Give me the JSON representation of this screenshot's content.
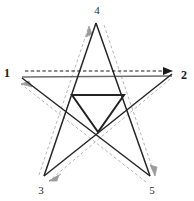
{
  "diagram": {
    "type": "pentagram-with-directed-path",
    "colors": {
      "background": "#ffffff",
      "star_edge": "#262626",
      "base_line": "#6e6e6e",
      "path_dash": "#b6b6b6",
      "main_dash": "#1a1a1a",
      "inner_triangle": "#232323",
      "label": "#1a1a1a"
    },
    "vertices": [
      {
        "id": "v1",
        "label": "1",
        "x": 10,
        "y": 72,
        "point_x": 24,
        "point_y": 73,
        "label_anchor": "end",
        "bold": true
      },
      {
        "id": "v2",
        "label": "2",
        "x": 186,
        "y": 73,
        "point_x": 171,
        "point_y": 73,
        "label_anchor": "start",
        "bold": true
      },
      {
        "id": "v3",
        "label": "3",
        "x": 41,
        "y": 190,
        "point_x": 44,
        "point_y": 177,
        "label_anchor": "middle",
        "bold": false
      },
      {
        "id": "v4",
        "label": "4",
        "x": 97,
        "y": 13,
        "point_x": 97,
        "point_y": 22,
        "label_anchor": "middle",
        "bold": false
      },
      {
        "id": "v5",
        "label": "5",
        "x": 152,
        "y": 190,
        "point_x": 150,
        "point_y": 177,
        "label_anchor": "middle",
        "bold": false
      }
    ],
    "star_outline_order": [
      "1",
      "2",
      "3",
      "4",
      "5",
      "1"
    ],
    "edges": [
      {
        "from": "1",
        "to": "2",
        "style": "solid-gray-horizontal"
      },
      {
        "from": "2",
        "to": "3",
        "style": "solid-black"
      },
      {
        "from": "3",
        "to": "4",
        "style": "solid-black"
      },
      {
        "from": "4",
        "to": "5",
        "style": "solid-black"
      },
      {
        "from": "5",
        "to": "1",
        "style": "solid-black"
      }
    ],
    "directed_path": [
      {
        "from": "1",
        "to": "2",
        "style": "dashed-black",
        "arrow": "at-2",
        "direction": "right"
      },
      {
        "from": "2",
        "to": "3",
        "style": "dashed-gray",
        "arrow": "at-3",
        "direction": "down-left"
      },
      {
        "from": "3",
        "to": "4",
        "style": "dashed-gray",
        "arrow": "at-4",
        "direction": "up-right"
      },
      {
        "from": "4",
        "to": "5",
        "style": "dashed-gray",
        "arrow": "at-5",
        "direction": "down-right"
      },
      {
        "from": "5",
        "to": "1",
        "style": "dashed-gray",
        "arrow": "at-1",
        "direction": "up-left"
      }
    ],
    "inner_shape": {
      "name": "inverted-triangle",
      "orientation": "point-down",
      "points": "72,95 124,95 98,132"
    }
  }
}
